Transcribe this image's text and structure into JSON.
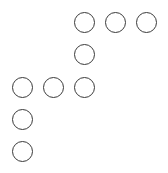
{
  "diagram": {
    "stroke_color": "#3a3a3a",
    "background_color": "#ffffff",
    "circle_diameter": 22,
    "circles": [
      {
        "id": "c1",
        "row": 1,
        "col": 3,
        "x": 74,
        "y": 12
      },
      {
        "id": "c2",
        "row": 1,
        "col": 4,
        "x": 105,
        "y": 12
      },
      {
        "id": "c3",
        "row": 1,
        "col": 5,
        "x": 136,
        "y": 12
      },
      {
        "id": "c4",
        "row": 2,
        "col": 3,
        "x": 74,
        "y": 44
      },
      {
        "id": "c5",
        "row": 3,
        "col": 1,
        "x": 12,
        "y": 77
      },
      {
        "id": "c6",
        "row": 3,
        "col": 2,
        "x": 43,
        "y": 77
      },
      {
        "id": "c7",
        "row": 3,
        "col": 3,
        "x": 74,
        "y": 77
      },
      {
        "id": "c8",
        "row": 4,
        "col": 1,
        "x": 12,
        "y": 109
      },
      {
        "id": "c9",
        "row": 5,
        "col": 1,
        "x": 12,
        "y": 141
      }
    ]
  }
}
